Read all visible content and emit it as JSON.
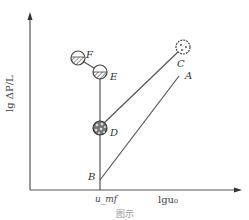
{
  "figure": {
    "y_axis_label": "lg ΔP/L",
    "x_axis_label": "lgu₀",
    "x_tick_label": "u_mf",
    "points": [
      {
        "id": "A",
        "label": "A",
        "fill": "none"
      },
      {
        "id": "B",
        "label": "B",
        "fill": "none"
      },
      {
        "id": "C",
        "label": "C",
        "fill": "dotted"
      },
      {
        "id": "D",
        "label": "D",
        "fill": "patterned"
      },
      {
        "id": "E",
        "label": "E",
        "fill": "half-hatched"
      },
      {
        "id": "F",
        "label": "F",
        "fill": "hatched"
      }
    ],
    "caption": "图示"
  },
  "colors": {
    "line": "#555555",
    "text": "#333333"
  }
}
